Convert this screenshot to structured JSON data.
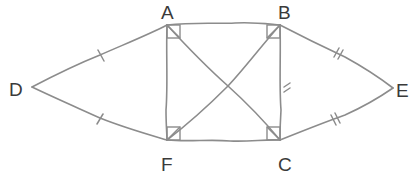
{
  "diagram": {
    "type": "geometry-figure",
    "colors": {
      "line": "#8c8c8c",
      "label": "#3a3a3a",
      "background": "#ffffff"
    },
    "vertices": {
      "A": {
        "label": "A",
        "x": 167,
        "y": 25
      },
      "B": {
        "label": "B",
        "x": 280,
        "y": 25
      },
      "C": {
        "label": "C",
        "x": 280,
        "y": 140
      },
      "F": {
        "label": "F",
        "x": 167,
        "y": 140
      },
      "D": {
        "label": "D",
        "x": 32,
        "y": 87
      },
      "E": {
        "label": "E",
        "x": 393,
        "y": 88
      }
    },
    "edges": [
      {
        "from": "A",
        "to": "B",
        "marks": 0
      },
      {
        "from": "F",
        "to": "C",
        "marks": 0
      },
      {
        "from": "A",
        "to": "F",
        "marks": 0
      },
      {
        "from": "B",
        "to": "C",
        "marks": 2
      },
      {
        "from": "A",
        "to": "C",
        "marks": 0
      },
      {
        "from": "B",
        "to": "F",
        "marks": 0
      },
      {
        "from": "D",
        "to": "A",
        "marks": 1
      },
      {
        "from": "D",
        "to": "F",
        "marks": 1
      },
      {
        "from": "B",
        "to": "E",
        "marks": 2
      },
      {
        "from": "C",
        "to": "E",
        "marks": 2
      }
    ],
    "right_angles": [
      "A",
      "B",
      "C",
      "F"
    ]
  }
}
